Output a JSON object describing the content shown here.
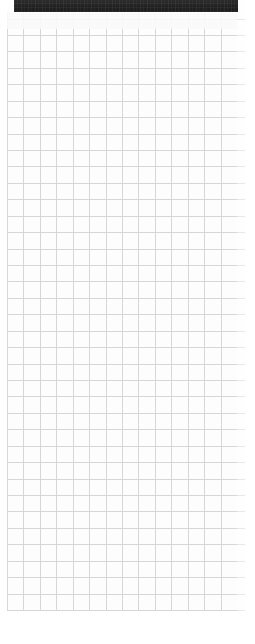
{
  "window": {
    "title": "",
    "width": 255,
    "height": 644,
    "background_color": "#fefefe"
  },
  "top_bar": {
    "name": "dark-toolbar",
    "label": "",
    "background_color": "#262626",
    "left": 14,
    "top": 0,
    "width": 224,
    "height": 12
  },
  "grid": {
    "name": "spreadsheet-grid",
    "cell_size_px": 16.43,
    "columns": 14,
    "rows": 36,
    "line_color": "#d7d7d7",
    "cell_color": "#fdfdfd",
    "left": 7,
    "top": 13,
    "width": 230,
    "height": 598
  },
  "margins": {
    "left_gutter_color": "#ffffff",
    "bottom_area_color": "#ffffff"
  }
}
